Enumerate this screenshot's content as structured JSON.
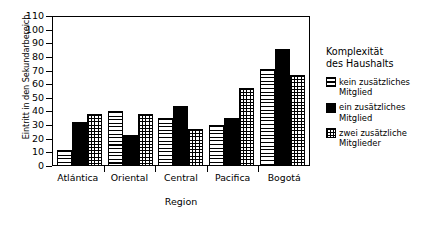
{
  "chart_data": {
    "type": "bar",
    "title": "",
    "xlabel": "Region",
    "ylabel": "Eintritt in den Sekundarbereich",
    "ylim": [
      0,
      110
    ],
    "yticks": [
      0,
      10,
      20,
      30,
      40,
      50,
      60,
      70,
      80,
      90,
      100,
      110
    ],
    "grid": false,
    "legend_position": "right",
    "legend_title_line1": "Komplexität",
    "legend_title_line2": "des Haushalts",
    "categories": [
      "Atlántica",
      "Oriental",
      "Central",
      "Pacifica",
      "Bogotá"
    ],
    "series": [
      {
        "name": "kein zusätzliches Mitglied",
        "pattern": "horizontal-lines",
        "values": [
          12,
          40,
          35,
          30,
          71
        ]
      },
      {
        "name": "ein zusätzliches Mitglied",
        "pattern": "solid-black",
        "values": [
          32,
          23,
          44,
          35,
          86
        ]
      },
      {
        "name": "zwei zusätzliche Mitglieder",
        "pattern": "grid-crosshatch",
        "values": [
          38,
          38,
          27,
          57,
          67
        ]
      }
    ]
  },
  "colors": {
    "axis": "#000000",
    "background": "#ffffff",
    "bar_fill_solid": "#000000",
    "bar_outline": "#000000"
  }
}
